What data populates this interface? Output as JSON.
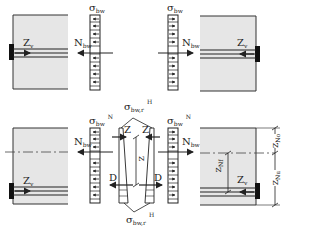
{
  "diagram": {
    "title": "",
    "colors": {
      "block_fill": "#e6e6e6",
      "line": "#222222",
      "anchor": "#111111"
    },
    "top_left": {
      "Zv": "Z",
      "Zv_sub": "v",
      "sigma": "σ",
      "sigma_sub": "bw",
      "N": "N",
      "N_sub": "bw"
    },
    "top_right": {
      "Zv": "Z",
      "Zv_sub": "v",
      "sigma": "σ",
      "sigma_sub": "bw",
      "N": "N",
      "N_sub": "bw"
    },
    "bottom_left": {
      "Zv": "Z",
      "Zv_sub": "v",
      "sigma": "σ",
      "sigma_sub": "bw",
      "sigma_sup": "N",
      "N": "N",
      "N_sub": "bw"
    },
    "bottom_center": {
      "sigma_top": "σ",
      "sigma_top_sub": "bw,r",
      "sigma_top_sup": "H",
      "sigma_bot": "σ",
      "sigma_bot_sub": "bw,r",
      "sigma_bot_sup": "H",
      "Z_left": "Z",
      "Z_right": "Z",
      "D_left": "D",
      "D_right": "D",
      "z": "z"
    },
    "bottom_right": {
      "sigma": "σ",
      "sigma_sub": "bw",
      "sigma_sup": "N",
      "N": "N",
      "N_sub": "bw",
      "Zv": "Z",
      "Zv_sub": "v",
      "zNf": "z",
      "zNf_sub": "Nf",
      "zNo": "z",
      "zNo_sub": "No",
      "zNu": "z",
      "zNu_sub": "Nu"
    }
  }
}
